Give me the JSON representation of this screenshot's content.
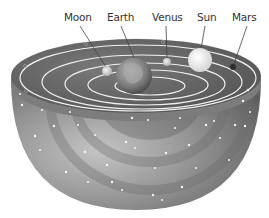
{
  "diagram": {
    "type": "geocentric-model-cutaway",
    "labels": [
      {
        "id": "moon",
        "text": "Moon",
        "x": 64,
        "y": 11,
        "target": [
          107,
          68
        ]
      },
      {
        "id": "earth",
        "text": "Earth",
        "x": 107,
        "y": 11,
        "target": [
          134,
          62
        ]
      },
      {
        "id": "venus",
        "text": "Venus",
        "x": 152,
        "y": 11,
        "target": [
          166,
          58
        ]
      },
      {
        "id": "sun",
        "text": "Sun",
        "x": 197,
        "y": 11,
        "target": [
          201,
          50
        ]
      },
      {
        "id": "mars",
        "text": "Mars",
        "x": 232,
        "y": 11,
        "target": [
          233,
          64
        ]
      }
    ],
    "bodies": [
      {
        "id": "moon",
        "cx": 107,
        "cy": 70,
        "r": 5,
        "fill": "#d8d8d8"
      },
      {
        "id": "earth",
        "cx": 134,
        "cy": 76,
        "r": 18,
        "fill": "#8a8a8a"
      },
      {
        "id": "venus",
        "cx": 167,
        "cy": 62,
        "r": 4,
        "fill": "#d0d0d0"
      },
      {
        "id": "sun",
        "cx": 200,
        "cy": 60,
        "r": 12,
        "fill": "#e8e8e8"
      },
      {
        "id": "mars",
        "cx": 233,
        "cy": 67,
        "r": 3,
        "fill": "#333333"
      }
    ],
    "colors": {
      "shell_dark": "#5a5a5a",
      "shell_mid": "#8c8c8c",
      "shell_light": "#c8c8c8",
      "orbit_line": "#f2f2f2",
      "label_text": "#333333",
      "leader_line": "#444444"
    }
  }
}
